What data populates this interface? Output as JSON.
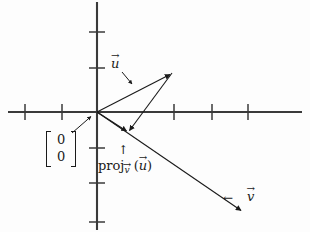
{
  "figure": {
    "background_color": "#fdfdfd",
    "ink_color": "#1a1a1a",
    "axis_color": "#3a3a3a"
  },
  "axes": {
    "origin": {
      "x": 97,
      "y": 112
    },
    "x_axis": {
      "from_x": 8,
      "to_x": 302,
      "y": 112
    },
    "y_axis": {
      "x": 97,
      "from_y": 2,
      "to_y": 230
    },
    "tick_half_length": 8,
    "x_ticks": [
      25,
      62,
      174,
      212,
      248
    ],
    "y_ticks": [
      32,
      68,
      148,
      183,
      222
    ]
  },
  "vectors": [
    {
      "name": "u",
      "label": "u",
      "has_overarrow": true,
      "from": {
        "x": 97,
        "y": 112
      },
      "to": {
        "x": 172,
        "y": 73
      }
    },
    {
      "name": "v",
      "label": "v",
      "has_overarrow": true,
      "from": {
        "x": 97,
        "y": 112
      },
      "to": {
        "x": 243,
        "y": 212
      }
    },
    {
      "name": "projection",
      "label": "proj",
      "has_overarrow": false,
      "from": {
        "x": 97,
        "y": 112
      },
      "to": {
        "x": 128,
        "y": 132
      }
    },
    {
      "name": "perpendicular-drop",
      "label": "",
      "has_overarrow": false,
      "from": {
        "x": 172,
        "y": 73
      },
      "to": {
        "x": 128,
        "y": 132
      }
    }
  ],
  "labels": {
    "u_vector": {
      "text": "u",
      "overarrow": "→"
    },
    "v_vector": {
      "text": "v",
      "overarrow": "→"
    },
    "v_pointer_arrow": "←",
    "proj_up_arrow": "↑",
    "projection": {
      "head": "proj",
      "subscript_base": "v",
      "subscript_arrow": "→",
      "open_paren": "(",
      "argument_base": "u",
      "argument_arrow": "→",
      "close_paren": ")",
      "full_text": "proj_v⃗ (u⃗)"
    },
    "origin_matrix": {
      "row1": "0",
      "row2": "0",
      "description": "zero column vector labelling the origin"
    }
  },
  "annotation_arrows": [
    {
      "name": "u-label-pointer",
      "from": {
        "x": 122,
        "y": 72
      },
      "to": {
        "x": 133,
        "y": 85
      }
    },
    {
      "name": "origin-matrix-pointer",
      "from": {
        "x": 72,
        "y": 133
      },
      "to": {
        "x": 92,
        "y": 116
      }
    }
  ]
}
